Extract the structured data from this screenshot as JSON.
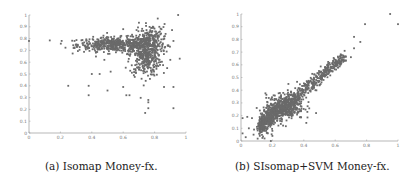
{
  "figure": {
    "panels": [
      {
        "id": "a",
        "caption": "(a) Isomap Money-fx."
      },
      {
        "id": "b",
        "caption": "(b) SIsomap+SVM Money-fx."
      }
    ]
  },
  "chart_data": [
    {
      "type": "scatter",
      "title": "(a) Isomap Money-fx.",
      "xlabel": "",
      "ylabel": "",
      "xlim": [
        0,
        1
      ],
      "ylim": [
        0,
        1
      ],
      "xticks": [
        "0",
        "0.2",
        "0.4",
        "0.6",
        "0.8",
        "1"
      ],
      "yticks": [
        "0",
        "0.1",
        "0.2",
        "0.3",
        "0.4",
        "0.5",
        "0.6",
        "0.7",
        "0.8",
        "0.9",
        "1"
      ],
      "grid": false,
      "marker_color": "#6a6a6a",
      "description": "Dense horizontal band around y≈0.72-0.8 spanning x≈0.3-0.85, with a vertical plume below x≈0.7-0.8 down to y≈0.4; scattered outliers.",
      "clusters": [
        {
          "cx": 0.55,
          "cy": 0.75,
          "sx": 0.12,
          "sy": 0.03,
          "n": 500
        },
        {
          "cx": 0.74,
          "cy": 0.66,
          "sx": 0.05,
          "sy": 0.09,
          "n": 400
        },
        {
          "cx": 0.78,
          "cy": 0.8,
          "sx": 0.05,
          "sy": 0.06,
          "n": 150
        }
      ],
      "outliers": [
        [
          0.0,
          0.78
        ],
        [
          0.25,
          0.4
        ],
        [
          0.38,
          0.4
        ],
        [
          0.38,
          0.32
        ],
        [
          0.5,
          0.36
        ],
        [
          0.6,
          0.39
        ],
        [
          0.62,
          0.32
        ],
        [
          0.64,
          0.32
        ],
        [
          0.76,
          0.28
        ],
        [
          0.76,
          0.26
        ],
        [
          0.76,
          0.21
        ],
        [
          0.74,
          0.17
        ],
        [
          0.92,
          0.21
        ],
        [
          0.86,
          0.39
        ],
        [
          0.92,
          0.39
        ],
        [
          0.96,
          0.63
        ],
        [
          0.95,
          1.0
        ],
        [
          0.82,
          0.97
        ],
        [
          0.92,
          0.78
        ],
        [
          0.29,
          0.78
        ],
        [
          0.3,
          0.75
        ],
        [
          0.29,
          0.72
        ],
        [
          0.6,
          0.88
        ],
        [
          0.48,
          0.62
        ],
        [
          0.45,
          0.5
        ],
        [
          0.4,
          0.5
        ],
        [
          0.52,
          0.52
        ],
        [
          0.87,
          0.84
        ],
        [
          0.88,
          0.55
        ],
        [
          0.9,
          0.62
        ]
      ]
    },
    {
      "type": "scatter",
      "title": "(b) SIsomap+SVM Money-fx.",
      "xlabel": "",
      "ylabel": "",
      "xlim": [
        0,
        1
      ],
      "ylim": [
        0,
        1
      ],
      "xticks": [
        "0",
        "0.2",
        "0.4",
        "0.6",
        "0.8",
        "1"
      ],
      "yticks": [
        "0",
        "0.1",
        "0.2",
        "0.3",
        "0.4",
        "0.5",
        "0.6",
        "0.7",
        "0.8",
        "0.9",
        "1"
      ],
      "grid": false,
      "marker_color": "#6a6a6a",
      "description": "Strong positive linear trend from (0.1,0.15) to (0.65,0.65), densest around (0.3,0.3); sparse outliers near the origin and top-right.",
      "trend": {
        "slope": 1.0,
        "intercept": 0.0,
        "x_range": [
          0.12,
          0.66
        ],
        "spread": 0.04,
        "n": 900
      },
      "clusters": [
        {
          "cx": 0.28,
          "cy": 0.27,
          "sx": 0.06,
          "sy": 0.05,
          "n": 350
        }
      ],
      "outliers": [
        [
          0.95,
          1.0
        ],
        [
          0.79,
          0.92
        ],
        [
          1.0,
          0.92
        ],
        [
          0.72,
          0.82
        ],
        [
          0.76,
          0.78
        ],
        [
          0.72,
          0.73
        ],
        [
          0.66,
          0.71
        ],
        [
          0.7,
          0.66
        ],
        [
          0.01,
          0.18
        ],
        [
          0.01,
          0.06
        ],
        [
          0.04,
          0.19
        ],
        [
          0.05,
          0.1
        ],
        [
          0.08,
          0.05
        ],
        [
          0.12,
          0.08
        ],
        [
          0.15,
          0.02
        ],
        [
          0.17,
          0.06
        ],
        [
          0.19,
          0.0
        ],
        [
          0.2,
          0.04
        ],
        [
          0.07,
          0.18
        ],
        [
          0.1,
          0.26
        ],
        [
          0.12,
          0.24
        ],
        [
          0.03,
          0.03
        ],
        [
          0.14,
          0.14
        ],
        [
          0.2,
          0.08
        ]
      ]
    }
  ]
}
